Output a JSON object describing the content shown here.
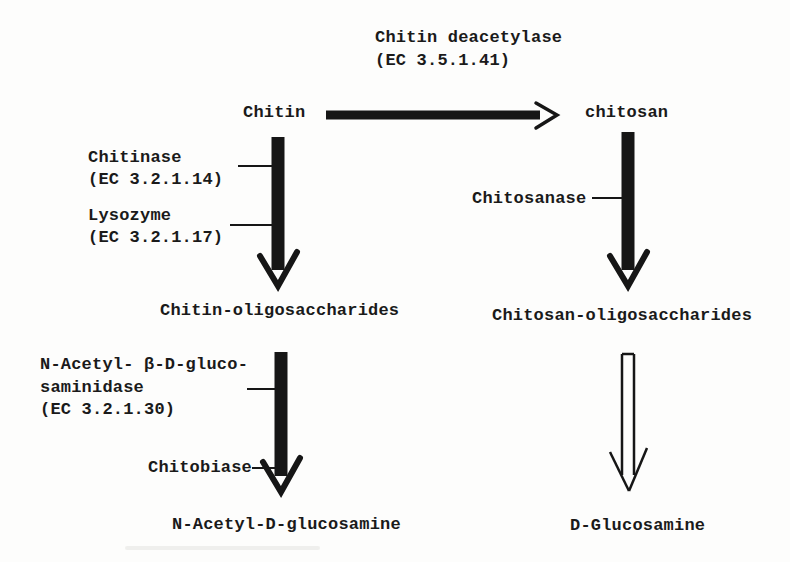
{
  "figure": {
    "type": "enzymatic-pathway-diagram",
    "colors": {
      "ink": "#1a1a1a",
      "background": "#fdfdfc"
    }
  },
  "reactions": {
    "top_enzyme": {
      "name": "Chitin deacetylase",
      "ec": "(EC 3.5.1.41)"
    },
    "substrates": {
      "chitin": "Chitin",
      "chitosan": "chitosan",
      "chitin_oligosaccharides": "Chitin-oligosaccharides",
      "chitosan_oligosaccharides": "Chitosan-oligosaccharides",
      "n_acetyl_d_glucosamine": "N-Acetyl-D-glucosamine",
      "d_glucosamine": "D-Glucosamine"
    },
    "left_pathway_enzymes": [
      {
        "name": "Chitinase",
        "ec": "(EC 3.2.1.14)"
      },
      {
        "name": "Lysozyme",
        "ec": "(EC 3.2.1.17)"
      }
    ],
    "right_pathway_enzyme": {
      "name": "Chitosanase"
    },
    "lower_left_enzyme": {
      "line1": "N-Acetyl- β-D-gluco-",
      "line2": "saminidase",
      "line3": "(EC 3.2.1.30)"
    },
    "chitobiase": {
      "name": "Chitobiase"
    }
  }
}
